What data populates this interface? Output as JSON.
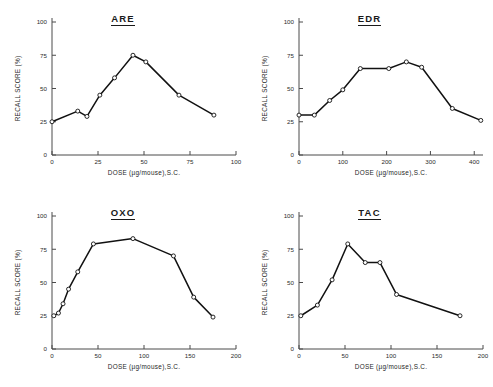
{
  "figure": {
    "background": "#ffffff",
    "line_color": "#111111",
    "axis_color": "#4a4a4a",
    "panel_count": 4
  },
  "panels": [
    {
      "title": "ARE"
    },
    {
      "title": "EDR"
    },
    {
      "title": "OXO"
    },
    {
      "title": "TAC"
    }
  ],
  "axis_titles": {
    "x": "DOSE (µg/mouse),S.C.",
    "y": "RECALL SCORE (%)"
  },
  "chart_data": [
    {
      "type": "line",
      "title": "ARE",
      "xlabel": "DOSE (µg/mouse),S.C.",
      "ylabel": "RECALL SCORE (%)",
      "xlim": [
        0,
        100
      ],
      "ylim": [
        0,
        100
      ],
      "xticks": [
        0,
        25,
        50,
        75,
        100
      ],
      "yticks": [
        0,
        25,
        50,
        75,
        100
      ],
      "grid": false,
      "legend": "none",
      "markers": "open-circle",
      "x": [
        0,
        14,
        19,
        26,
        34,
        44,
        51,
        69,
        88
      ],
      "y": [
        25,
        33,
        29,
        45,
        58,
        75,
        70,
        45,
        30
      ]
    },
    {
      "type": "line",
      "title": "EDR",
      "xlabel": "DOSE (µg/mouse),S.C.",
      "ylabel": "RECALL SCORE (%)",
      "xlim": [
        0,
        420
      ],
      "ylim": [
        0,
        100
      ],
      "xticks": [
        0,
        100,
        200,
        300,
        400
      ],
      "yticks": [
        0,
        25,
        50,
        75,
        100
      ],
      "grid": false,
      "legend": "none",
      "markers": "open-circle",
      "x": [
        0,
        35,
        70,
        100,
        140,
        205,
        245,
        280,
        350,
        415
      ],
      "y": [
        30,
        30,
        41,
        49,
        65,
        65,
        70,
        66,
        35,
        26
      ]
    },
    {
      "type": "line",
      "title": "OXO",
      "xlabel": "DOSE (µg/mouse),S.C.",
      "ylabel": "RECALL SCORE (%)",
      "xlim": [
        0,
        200
      ],
      "ylim": [
        0,
        100
      ],
      "xticks": [
        0,
        50,
        100,
        150,
        200
      ],
      "yticks": [
        0,
        25,
        50,
        75,
        100
      ],
      "grid": false,
      "legend": "none",
      "markers": "open-circle",
      "x": [
        2,
        7,
        12,
        18,
        28,
        45,
        88,
        132,
        154,
        175
      ],
      "y": [
        25,
        27,
        34,
        45,
        58,
        79,
        83,
        70,
        39,
        24
      ]
    },
    {
      "type": "line",
      "title": "TAC",
      "xlabel": "DOSE (µg/mouse),S.C.",
      "ylabel": "RECALL SCORE (%)",
      "xlim": [
        0,
        200
      ],
      "ylim": [
        0,
        100
      ],
      "xticks": [
        0,
        50,
        100,
        150,
        200
      ],
      "yticks": [
        0,
        25,
        50,
        75,
        100
      ],
      "grid": false,
      "legend": "none",
      "markers": "open-circle",
      "x": [
        2,
        20,
        36,
        53,
        72,
        88,
        106,
        175
      ],
      "y": [
        25,
        33,
        52,
        79,
        65,
        65,
        41,
        25
      ]
    }
  ]
}
